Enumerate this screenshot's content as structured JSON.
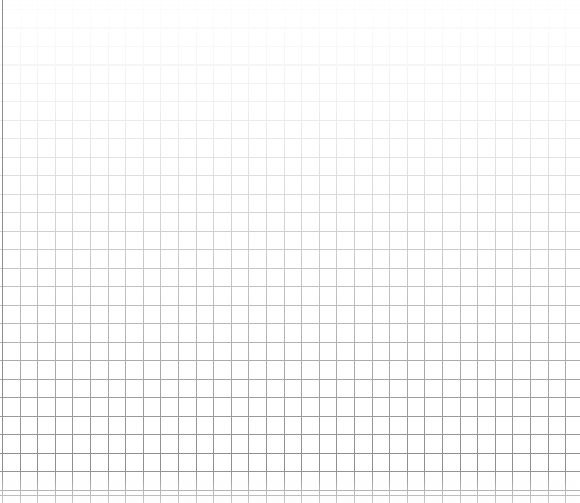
{
  "document": {
    "kind": "grid-sheet",
    "width": 580,
    "height": 503,
    "background_color": "#ffffff"
  },
  "heading": {
    "text": "",
    "note": "cropped-off-top-edge",
    "color": "#c9c9cf"
  },
  "grid": {
    "column_width": 17.6,
    "row_height": 18.5,
    "column_count": 33,
    "row_count": 27,
    "offset_x": 2,
    "offset_y": 9,
    "line_color": "#8d8d8d",
    "line_width": 1,
    "fade_direction": "top-to-bottom",
    "fade_top_opacity": 0.02,
    "fade_bottom_opacity": 1.0
  },
  "rules": {
    "baseline_y": 495,
    "left_margin_x": 2,
    "color": "#8d8d8d"
  },
  "chart_data": {
    "type": "table",
    "title": "",
    "subtitle": "",
    "xlabel": "",
    "ylabel": "",
    "categories": [],
    "values": [],
    "series": [],
    "grid": true,
    "legend_position": "none",
    "annotations": []
  }
}
